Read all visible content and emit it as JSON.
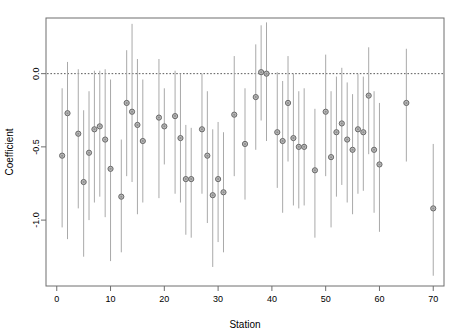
{
  "figure": {
    "title": "",
    "background_color": "#ffffff",
    "point_color": "#b9b9b9",
    "point_edge_color": "#6a6a6a",
    "line_color": "#a9a9a9",
    "axis_color": "#6e6e6e",
    "refline_color": "#5a5a5a"
  },
  "chart_data": {
    "type": "scatter",
    "title": "",
    "subtitle": "",
    "xlabel": "Station",
    "ylabel": "Coefficient",
    "xlim": [
      -2,
      72
    ],
    "ylim": [
      -1.45,
      0.38
    ],
    "grid": false,
    "legend": null,
    "legend_position": "none",
    "annotations": [
      {
        "type": "hline",
        "y": 0.0,
        "style": "dotted",
        "label": "zero reference line"
      }
    ],
    "xticks": [
      0,
      10,
      20,
      30,
      40,
      50,
      60,
      70
    ],
    "xticklabels": [
      "0",
      "10",
      "20",
      "30",
      "40",
      "50",
      "60",
      "70"
    ],
    "yticks": [
      0.0,
      -0.5,
      -1.0
    ],
    "yticklabels": [
      "0.0",
      "-0.5",
      "-1.0"
    ],
    "error_bars": true,
    "error_bar_style": "vertical-line-no-caps",
    "series": [
      {
        "name": "Station coefficient estimate",
        "marker": "circle-open-filled",
        "points": [
          {
            "x": 1,
            "y": -0.56,
            "lo": -1.05,
            "hi": -0.1
          },
          {
            "x": 2,
            "y": -0.27,
            "lo": -1.13,
            "hi": 0.08
          },
          {
            "x": 4,
            "y": -0.41,
            "lo": -0.92,
            "hi": 0.03
          },
          {
            "x": 5,
            "y": -0.74,
            "lo": -1.25,
            "hi": -0.25
          },
          {
            "x": 6,
            "y": -0.54,
            "lo": -1.0,
            "hi": -0.12
          },
          {
            "x": 7,
            "y": -0.38,
            "lo": -0.88,
            "hi": 0.02
          },
          {
            "x": 8,
            "y": -0.36,
            "lo": -0.84,
            "hi": 0.02
          },
          {
            "x": 9,
            "y": -0.45,
            "lo": -0.98,
            "hi": 0.03
          },
          {
            "x": 10,
            "y": -0.65,
            "lo": -1.28,
            "hi": -0.04
          },
          {
            "x": 12,
            "y": -0.84,
            "lo": -1.22,
            "hi": -0.45
          },
          {
            "x": 13,
            "y": -0.2,
            "lo": -0.7,
            "hi": 0.16
          },
          {
            "x": 14,
            "y": -0.26,
            "lo": -0.74,
            "hi": 0.34
          },
          {
            "x": 15,
            "y": -0.35,
            "lo": -0.96,
            "hi": 0.1
          },
          {
            "x": 16,
            "y": -0.46,
            "lo": -0.88,
            "hi": -0.04
          },
          {
            "x": 19,
            "y": -0.3,
            "lo": -0.85,
            "hi": 0.1
          },
          {
            "x": 20,
            "y": -0.36,
            "lo": -0.62,
            "hi": -0.1
          },
          {
            "x": 22,
            "y": -0.29,
            "lo": -0.82,
            "hi": 0.02
          },
          {
            "x": 23,
            "y": -0.44,
            "lo": -0.88,
            "hi": 0.0
          },
          {
            "x": 24,
            "y": -0.72,
            "lo": -1.1,
            "hi": -0.35
          },
          {
            "x": 25,
            "y": -0.72,
            "lo": -1.12,
            "hi": -0.37
          },
          {
            "x": 27,
            "y": -0.38,
            "lo": -0.82,
            "hi": 0.0
          },
          {
            "x": 28,
            "y": -0.56,
            "lo": -1.02,
            "hi": -0.12
          },
          {
            "x": 29,
            "y": -0.83,
            "lo": -1.32,
            "hi": -0.38
          },
          {
            "x": 30,
            "y": -0.72,
            "lo": -1.15,
            "hi": -0.33
          },
          {
            "x": 31,
            "y": -0.81,
            "lo": -1.22,
            "hi": -0.4
          },
          {
            "x": 33,
            "y": -0.28,
            "lo": -0.7,
            "hi": 0.12
          },
          {
            "x": 35,
            "y": -0.48,
            "lo": -0.86,
            "hi": -0.1
          },
          {
            "x": 37,
            "y": -0.16,
            "lo": -0.52,
            "hi": 0.2
          },
          {
            "x": 38,
            "y": 0.01,
            "lo": -0.32,
            "hi": 0.33
          },
          {
            "x": 39,
            "y": 0.0,
            "lo": -0.46,
            "hi": 0.35
          },
          {
            "x": 41,
            "y": -0.4,
            "lo": -0.78,
            "hi": 0.01
          },
          {
            "x": 42,
            "y": -0.46,
            "lo": -0.95,
            "hi": -0.05
          },
          {
            "x": 43,
            "y": -0.2,
            "lo": -0.6,
            "hi": 0.12
          },
          {
            "x": 44,
            "y": -0.44,
            "lo": -0.9,
            "hi": 0.0
          },
          {
            "x": 45,
            "y": -0.5,
            "lo": -0.92,
            "hi": -0.12
          },
          {
            "x": 46,
            "y": -0.5,
            "lo": -0.9,
            "hi": -0.1
          },
          {
            "x": 48,
            "y": -0.66,
            "lo": -1.12,
            "hi": -0.24
          },
          {
            "x": 50,
            "y": -0.26,
            "lo": -0.7,
            "hi": 0.13
          },
          {
            "x": 51,
            "y": -0.57,
            "lo": -1.05,
            "hi": -0.12
          },
          {
            "x": 52,
            "y": -0.4,
            "lo": -0.84,
            "hi": -0.02
          },
          {
            "x": 53,
            "y": -0.34,
            "lo": -0.76,
            "hi": 0.04
          },
          {
            "x": 54,
            "y": -0.45,
            "lo": -0.88,
            "hi": -0.06
          },
          {
            "x": 55,
            "y": -0.52,
            "lo": -0.96,
            "hi": -0.14
          },
          {
            "x": 56,
            "y": -0.38,
            "lo": -0.82,
            "hi": 0.0
          },
          {
            "x": 57,
            "y": -0.4,
            "lo": -0.8,
            "hi": -0.02
          },
          {
            "x": 58,
            "y": -0.15,
            "lo": -0.55,
            "hi": 0.18
          },
          {
            "x": 59,
            "y": -0.52,
            "lo": -0.95,
            "hi": -0.12
          },
          {
            "x": 60,
            "y": -0.62,
            "lo": -1.08,
            "hi": -0.2
          },
          {
            "x": 65,
            "y": -0.2,
            "lo": -0.6,
            "hi": 0.17
          },
          {
            "x": 70,
            "y": -0.92,
            "lo": -1.38,
            "hi": -0.48
          }
        ]
      }
    ]
  }
}
